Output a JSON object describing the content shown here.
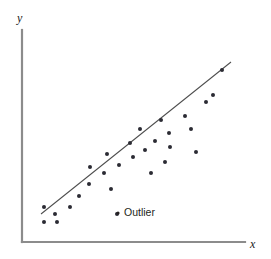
{
  "figure": {
    "width": 271,
    "height": 259,
    "background": "#ffffff"
  },
  "axes": {
    "y_label": "y",
    "x_label": "x",
    "color": "#8c8c8c",
    "origin": [
      22,
      242
    ],
    "y_top": [
      22,
      30
    ],
    "x_right": [
      245,
      242
    ],
    "line_width": 2.2
  },
  "annotation": {
    "outlier_label": "Outlier",
    "color": "#231f20"
  },
  "style": {
    "point_color": "#2b2b33",
    "point_radius": 2.0,
    "trend_color": "#4d4d4d",
    "trend_width": 1.1
  },
  "chart_data": {
    "type": "scatter",
    "title": "",
    "xlabel": "x",
    "ylabel": "y",
    "grid": false,
    "legend": "none",
    "axis_ticks": [],
    "xlim": [
      0,
      100
    ],
    "ylim": [
      0,
      100
    ],
    "annotations": [
      {
        "text": "Outlier",
        "point": [
          45.0,
          15.0
        ],
        "px": [
          117,
          214
        ]
      }
    ],
    "trendline": {
      "label": "fitted line",
      "px_start": [
        41,
        214
      ],
      "px_end": [
        231,
        62
      ],
      "data_start": [
        8.5,
        15.0
      ],
      "data_end": [
        98.0,
        86.5
      ]
    },
    "points_px": [
      [
        44,
        207
      ],
      [
        44,
        222
      ],
      [
        55,
        214
      ],
      [
        57,
        222
      ],
      [
        70,
        207
      ],
      [
        79,
        196
      ],
      [
        89,
        184
      ],
      [
        90,
        167
      ],
      [
        104,
        173
      ],
      [
        107,
        154
      ],
      [
        111,
        189
      ],
      [
        119,
        165
      ],
      [
        130,
        143
      ],
      [
        133,
        157
      ],
      [
        140,
        129
      ],
      [
        145,
        150
      ],
      [
        151,
        173
      ],
      [
        155,
        141
      ],
      [
        161,
        120
      ],
      [
        165,
        162
      ],
      [
        169,
        133
      ],
      [
        170,
        147
      ],
      [
        185,
        116
      ],
      [
        191,
        129
      ],
      [
        196,
        152
      ],
      [
        206,
        102
      ],
      [
        213,
        95
      ],
      [
        222,
        70
      ]
    ],
    "points": [
      [
        10.0,
        16.5
      ],
      [
        10.0,
        9.4
      ],
      [
        14.8,
        13.2
      ],
      [
        15.7,
        9.4
      ],
      [
        21.5,
        16.5
      ],
      [
        25.3,
        21.7
      ],
      [
        29.6,
        27.4
      ],
      [
        30.0,
        35.4
      ],
      [
        36.2,
        32.5
      ],
      [
        37.5,
        41.5
      ],
      [
        39.2,
        24.9
      ],
      [
        42.7,
        36.3
      ],
      [
        47.5,
        46.7
      ],
      [
        48.8,
        40.1
      ],
      [
        51.9,
        53.3
      ],
      [
        54.0,
        43.4
      ],
      [
        56.6,
        32.5
      ],
      [
        59.2,
        47.6
      ],
      [
        61.8,
        57.5
      ],
      [
        63.5,
        38.2
      ],
      [
        65.3,
        51.9
      ],
      [
        65.7,
        45.3
      ],
      [
        72.2,
        60.1
      ],
      [
        74.8,
        53.8
      ],
      [
        77.0,
        42.9
      ],
      [
        81.3,
        66.5
      ],
      [
        84.3,
        69.8
      ],
      [
        88.2,
        81.6
      ]
    ]
  }
}
